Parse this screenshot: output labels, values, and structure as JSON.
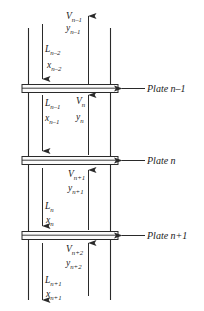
{
  "figure": {
    "ink_color": "#2a2a2a",
    "background_color": "#ffffff"
  },
  "plates": [
    {
      "id": "plate-n-minus-1",
      "label": "Plate n–1",
      "y": 85
    },
    {
      "id": "plate-n",
      "label": "Plate n",
      "y": 157
    },
    {
      "id": "plate-n-plus-1",
      "label": "Plate n+1",
      "y": 232
    }
  ],
  "streams": {
    "vapor_top": {
      "flow_symbol": "V",
      "flow_sub": "n–1",
      "comp_symbol": "y",
      "comp_sub": "n–1",
      "direction": "up"
    },
    "liquid_top": {
      "flow_symbol": "L",
      "flow_sub": "n–2",
      "comp_symbol": "x",
      "comp_sub": "n–2",
      "direction": "down"
    },
    "vapor_mid": {
      "flow_symbol": "V",
      "flow_sub": "n",
      "comp_symbol": "y",
      "comp_sub": "n",
      "direction": "up"
    },
    "liquid_mid": {
      "flow_symbol": "L",
      "flow_sub": "n–1",
      "comp_symbol": "x",
      "comp_sub": "n–1",
      "direction": "down"
    },
    "vapor_lower": {
      "flow_symbol": "V",
      "flow_sub": "n+1",
      "comp_symbol": "y",
      "comp_sub": "n+1",
      "direction": "up"
    },
    "liquid_lower": {
      "flow_symbol": "L",
      "flow_sub": "n",
      "comp_symbol": "x",
      "comp_sub": "n",
      "direction": "down"
    },
    "vapor_bottom": {
      "flow_symbol": "V",
      "flow_sub": "n+2",
      "comp_symbol": "y",
      "comp_sub": "n+2",
      "direction": "up"
    },
    "liquid_bottom": {
      "flow_symbol": "L",
      "flow_sub": "n+1",
      "comp_symbol": "x",
      "comp_sub": "n+1",
      "direction": "down"
    }
  }
}
